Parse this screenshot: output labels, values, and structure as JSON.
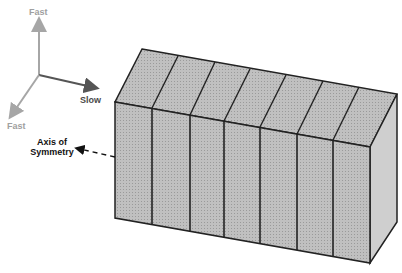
{
  "diagram": {
    "axes": {
      "up_label": "Fast",
      "right_label": "Slow",
      "down_left_label": "Fast",
      "colors": {
        "fast": "#a6a6a6",
        "slow": "#555555"
      }
    },
    "annotation": {
      "label_line1": "Axis of",
      "label_line2": "Symmetry"
    },
    "block": {
      "segments": 7,
      "face_color": "#bdbdbd",
      "top_color": "#c6c6c6",
      "side_color": "#cfcfcf",
      "edge_color": "#222222"
    }
  }
}
